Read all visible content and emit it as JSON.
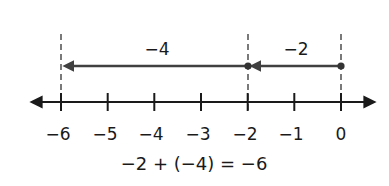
{
  "diagram": {
    "type": "number-line",
    "axis": {
      "min": -6,
      "max": 0,
      "ticks": [
        "-6",
        "-5",
        "-4",
        "-3",
        "-2",
        "-1",
        "0"
      ],
      "tick_labels": [
        "−6",
        "−5",
        "−4",
        "−3",
        "−2",
        "−1",
        "0"
      ]
    },
    "moves": [
      {
        "from": 0,
        "to": -2,
        "label": "−2"
      },
      {
        "from": -2,
        "to": -6,
        "label": "−4"
      }
    ],
    "points": [
      0,
      -2
    ],
    "guide_lines_at": [
      -6,
      -2,
      0
    ],
    "equation": "−2 + (−4) = −6",
    "colors": {
      "axis": "#1a1a1a",
      "arrow": "#404040",
      "guides": "#333333"
    }
  }
}
